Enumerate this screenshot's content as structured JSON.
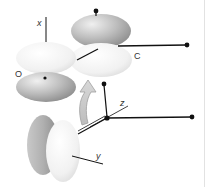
{
  "diagram": {
    "type": "orbital-overlap",
    "labels": {
      "x_axis": "x",
      "y_axis": "y",
      "z_axis": "z",
      "oxygen": "O",
      "carbon": "C"
    },
    "colors": {
      "lobe_dark": "#9a9a9a",
      "lobe_light": "#ececec",
      "line": "#111111",
      "arrow_fill": "#c8c8c8",
      "arrow_stroke": "#9a9a9a",
      "border": "#e2e2e2"
    },
    "elements": [
      {
        "name": "upper-p-orbital-pair-oxygen",
        "description": "p-orbital on O along x axis, light top lobe and dark bottom lobe"
      },
      {
        "name": "upper-p-orbital-pair-carbon",
        "description": "p-orbital on C, dark top lobe and light bottom lobe"
      },
      {
        "name": "curved-arrow",
        "description": "gray curved arrow pointing upward indicating rotation"
      },
      {
        "name": "lower-p-orbital-pair",
        "description": "p-orbital oriented along y axis, dark back lobe and light front lobe"
      },
      {
        "name": "axis-system",
        "description": "x, y, z axes with bonds terminated by black dots"
      }
    ]
  }
}
